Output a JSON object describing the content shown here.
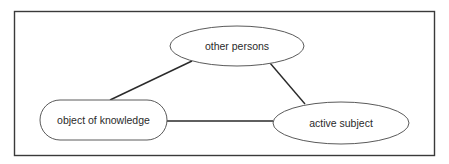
{
  "diagram": {
    "frame": {
      "x": 14,
      "y": 11,
      "width": 420,
      "height": 144,
      "stroke": "#3a3a3a"
    },
    "nodes": [
      {
        "id": "other_persons",
        "label": "other persons",
        "shape": "ellipse",
        "cx": 237,
        "cy": 46,
        "rx": 67,
        "ry": 20
      },
      {
        "id": "object_of_knowledge",
        "label": "object of knowledge",
        "shape": "rounded-rect",
        "x": 40,
        "y": 100,
        "width": 127,
        "height": 40,
        "radius": 20
      },
      {
        "id": "active_subject",
        "label": "active subject",
        "shape": "ellipse",
        "cx": 341,
        "cy": 123,
        "rx": 68,
        "ry": 21
      }
    ],
    "edges": [
      {
        "from": "object_of_knowledge",
        "to": "other_persons",
        "x1": 110,
        "y1": 100,
        "x2": 192,
        "y2": 61
      },
      {
        "from": "other_persons",
        "to": "active_subject",
        "x1": 270,
        "y1": 63,
        "x2": 305,
        "y2": 104
      },
      {
        "from": "object_of_knowledge",
        "to": "active_subject",
        "x1": 167,
        "y1": 121,
        "x2": 273,
        "y2": 121
      }
    ],
    "colors": {
      "node_stroke": "#5a5a5a",
      "edge_stroke": "#2a2a2a",
      "text": "#2a2a2a"
    }
  }
}
